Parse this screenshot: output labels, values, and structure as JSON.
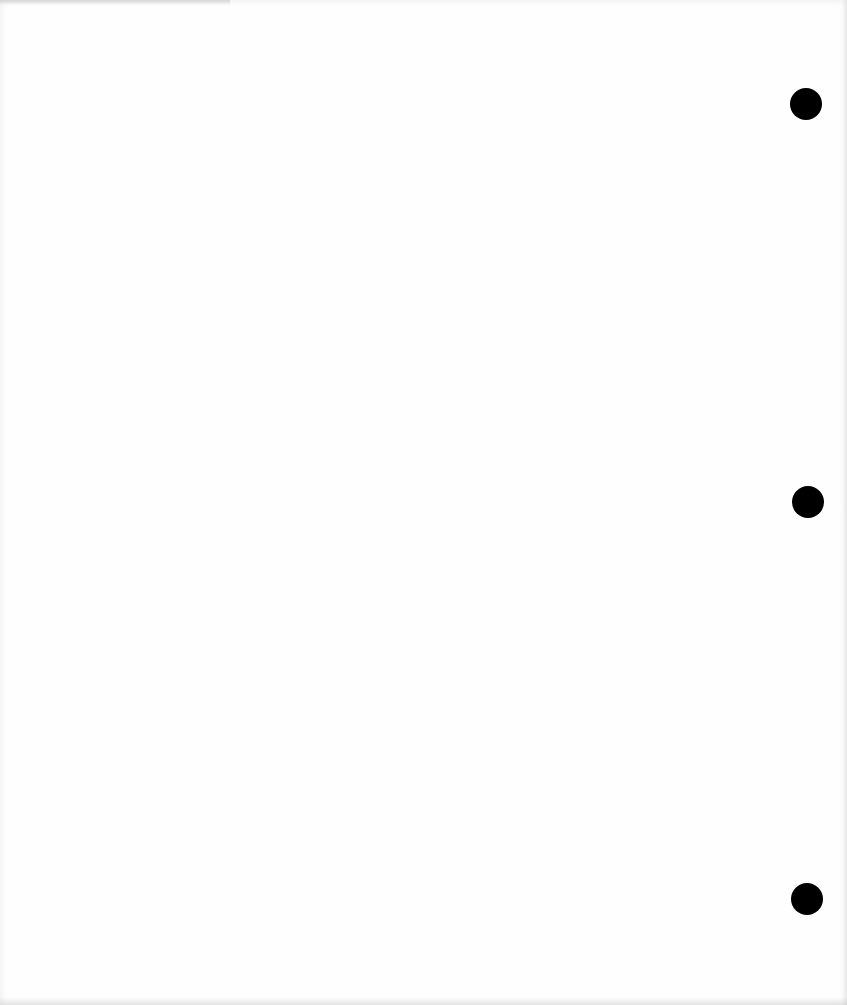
{
  "page": {
    "type": "blank three-hole punched paper",
    "background_color": "#fefefe",
    "hole_color": "#000000"
  },
  "holes": [
    {
      "label": "top",
      "cx": 806,
      "cy": 104,
      "diameter": 32
    },
    {
      "label": "middle",
      "cx": 808,
      "cy": 502,
      "diameter": 32
    },
    {
      "label": "bottom",
      "cx": 807,
      "cy": 899,
      "diameter": 32
    }
  ]
}
